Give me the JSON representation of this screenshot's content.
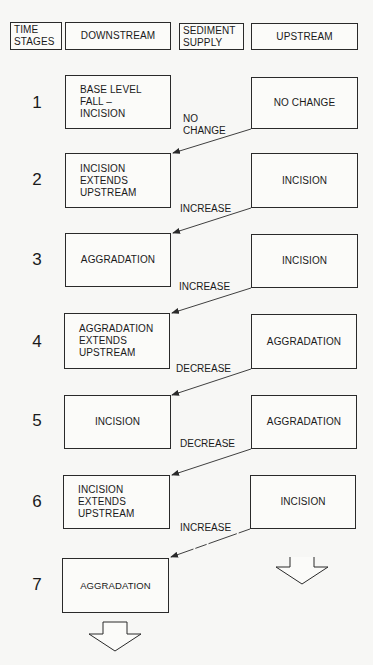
{
  "header": {
    "time_stages": "TIME\nSTAGES",
    "downstream": "DOWNSTREAM",
    "sediment_supply": "SEDIMENT\nSUPPLY",
    "upstream": "UPSTREAM"
  },
  "stages": [
    {
      "number": "1",
      "downstream": "BASE LEVEL\nFALL –\nINCISION",
      "upstream": "NO CHANGE",
      "sediment_supply": "NO\nCHANGE"
    },
    {
      "number": "2",
      "downstream": "INCISION\nEXTENDS\nUPSTREAM",
      "upstream": "INCISION",
      "sediment_supply": "INCREASE"
    },
    {
      "number": "3",
      "downstream": "AGGRADATION",
      "upstream": "INCISION",
      "sediment_supply": "INCREASE"
    },
    {
      "number": "4",
      "downstream": "AGGRADATION\nEXTENDS\nUPSTREAM",
      "upstream": "AGGRADATION",
      "sediment_supply": "DECREASE"
    },
    {
      "number": "5",
      "downstream": "INCISION",
      "upstream": "AGGRADATION",
      "sediment_supply": "DECREASE"
    },
    {
      "number": "6",
      "downstream": "INCISION\nEXTENDS\nUPSTREAM",
      "upstream": "INCISION",
      "sediment_supply": "INCREASE"
    },
    {
      "number": "7",
      "downstream": "AGGRADATION"
    }
  ],
  "icons": {
    "continuation_arrow_upstream": "hollow-down-arrow",
    "continuation_arrow_downstream": "hollow-down-arrow",
    "flow_arrows": "diagonal-arrow-upstream-to-downstream"
  },
  "colors": {
    "line": "#2a2a2a",
    "background": "#f7f7f5"
  }
}
